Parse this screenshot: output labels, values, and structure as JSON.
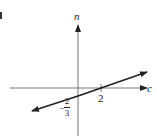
{
  "diagram": {
    "panel_mark": ")",
    "axes": {
      "horizontal": {
        "label": "c"
      },
      "vertical": {
        "label": "n"
      }
    },
    "intercepts": {
      "c_intercept": {
        "value": "2"
      },
      "n_intercept": {
        "sign": "−",
        "numerator": "2",
        "denominator": "3"
      }
    },
    "line": {
      "slope": "1/3",
      "arrows": "both ends",
      "color": "#222222"
    }
  }
}
